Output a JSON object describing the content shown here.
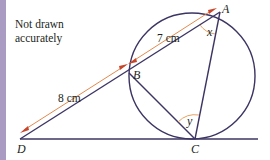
{
  "note": {
    "line1": "Not drawn",
    "line2": "accurately"
  },
  "points": {
    "A": "A",
    "B": "B",
    "C": "C",
    "D": "D"
  },
  "angles": {
    "x": "x",
    "y": "y"
  },
  "measurements": {
    "AB": "7 cm",
    "BD": "8 cm"
  },
  "colors": {
    "line": "#3d3463",
    "arrow": "#e07b39",
    "angle_arc": "#e8a060",
    "strip": "#a99bc2"
  }
}
